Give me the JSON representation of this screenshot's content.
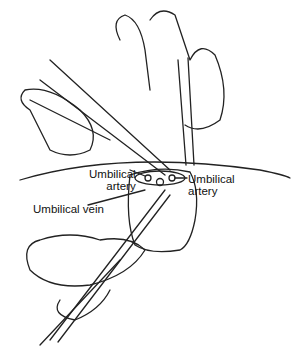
{
  "diagram": {
    "title": "",
    "labels": [
      {
        "id": "umbilical-artery-left",
        "line1": "Umbilical",
        "line2": "artery"
      },
      {
        "id": "umbilical-artery-right",
        "line1": "Umbilical",
        "line2": "artery"
      },
      {
        "id": "umbilical-vein",
        "line1": "Umbilical vein"
      }
    ]
  }
}
